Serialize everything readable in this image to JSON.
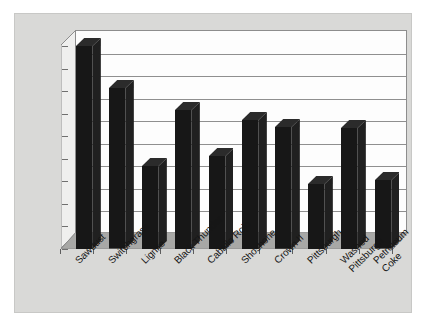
{
  "chart_data": {
    "type": "bar",
    "title": "",
    "subtitle": "",
    "xlabel": "",
    "ylabel": "",
    "ylim": [
      50,
      95
    ],
    "ytick_labels": [
      "95%",
      "90%",
      "85%",
      "80%",
      "75%",
      "70%",
      "65%",
      "60%",
      "55%",
      "50%"
    ],
    "ytick_values": [
      95,
      90,
      85,
      80,
      75,
      70,
      65,
      60,
      55,
      50
    ],
    "grid": true,
    "legend": "none",
    "style": "3d-column",
    "bar_color": "#171717",
    "plot_background": "#fdfdfd",
    "panel_background": "#d9d9d7",
    "categories": [
      "Sawdust",
      "Switchgrass",
      "Lignite",
      "Black Thunder",
      "Caballo Rojo",
      "Shoshone",
      "Crown II",
      "Pittsburgh",
      "Washed\nPittsburgh",
      "Petroleum\nCoke"
    ],
    "values": [
      95.0,
      85.6,
      68.4,
      80.8,
      70.6,
      78.6,
      77.0,
      64.4,
      76.8,
      65.2
    ],
    "value_unit": "%"
  }
}
